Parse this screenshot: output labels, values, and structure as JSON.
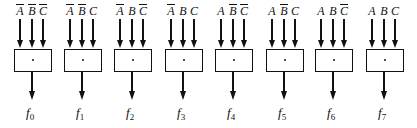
{
  "diagram": {
    "blocks": [
      {
        "inputs": [
          {
            "var": "A",
            "complement": true
          },
          {
            "var": "B",
            "complement": true
          },
          {
            "var": "C",
            "complement": true
          }
        ],
        "operator": "·",
        "output": "f",
        "index": "0"
      },
      {
        "inputs": [
          {
            "var": "A",
            "complement": true
          },
          {
            "var": "B",
            "complement": true
          },
          {
            "var": "C",
            "complement": false
          }
        ],
        "operator": "·",
        "output": "f",
        "index": "1"
      },
      {
        "inputs": [
          {
            "var": "A",
            "complement": true
          },
          {
            "var": "B",
            "complement": false
          },
          {
            "var": "C",
            "complement": true
          }
        ],
        "operator": "·",
        "output": "f",
        "index": "2"
      },
      {
        "inputs": [
          {
            "var": "A",
            "complement": true
          },
          {
            "var": "B",
            "complement": false
          },
          {
            "var": "C",
            "complement": false
          }
        ],
        "operator": "·",
        "output": "f",
        "index": "3"
      },
      {
        "inputs": [
          {
            "var": "A",
            "complement": false
          },
          {
            "var": "B",
            "complement": true
          },
          {
            "var": "C",
            "complement": true
          }
        ],
        "operator": "·",
        "output": "f",
        "index": "4"
      },
      {
        "inputs": [
          {
            "var": "A",
            "complement": false
          },
          {
            "var": "B",
            "complement": true
          },
          {
            "var": "C",
            "complement": false
          }
        ],
        "operator": "·",
        "output": "f",
        "index": "5"
      },
      {
        "inputs": [
          {
            "var": "A",
            "complement": false
          },
          {
            "var": "B",
            "complement": false
          },
          {
            "var": "C",
            "complement": true
          }
        ],
        "operator": "·",
        "output": "f",
        "index": "6"
      },
      {
        "inputs": [
          {
            "var": "A",
            "complement": false
          },
          {
            "var": "B",
            "complement": false
          },
          {
            "var": "C",
            "complement": false
          }
        ],
        "operator": "·",
        "output": "f",
        "index": "7"
      }
    ]
  }
}
